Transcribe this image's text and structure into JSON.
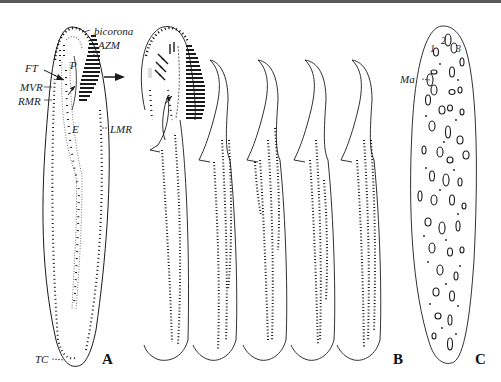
{
  "figure": {
    "panels": {
      "A": "A",
      "B": "B",
      "C": "C"
    },
    "labels": {
      "bicorona": "bicorona",
      "AZM": "AZM",
      "FT": "FT",
      "P": "P",
      "MVR": "MVR",
      "RMR": "RMR",
      "E": "E",
      "LMR": "LMR",
      "TC": "TC",
      "Ma": "Ma"
    },
    "macronucleus_numbers": [
      "1",
      "2",
      "3"
    ],
    "colors": {
      "ink": "#1a1a1a",
      "background": "#ffffff",
      "frame": "#5a5a5a"
    }
  }
}
